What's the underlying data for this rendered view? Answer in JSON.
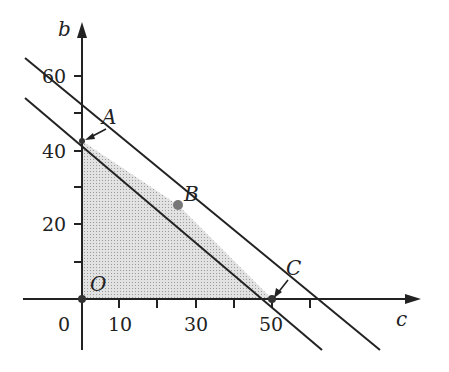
{
  "diagram": {
    "type": "linear-programming-feasible-region",
    "axes": {
      "x_label": "c",
      "y_label": "b",
      "origin_label": "0",
      "x_ticks": [
        {
          "value": 10,
          "label": "10"
        },
        {
          "value": 20,
          "label": ""
        },
        {
          "value": 30,
          "label": "30"
        },
        {
          "value": 40,
          "label": ""
        },
        {
          "value": 50,
          "label": "50"
        },
        {
          "value": 60,
          "label": ""
        }
      ],
      "y_ticks": [
        {
          "value": 10,
          "label": ""
        },
        {
          "value": 20,
          "label": "20"
        },
        {
          "value": 30,
          "label": ""
        },
        {
          "value": 40,
          "label": "40"
        },
        {
          "value": 50,
          "label": ""
        },
        {
          "value": 60,
          "label": "60"
        }
      ]
    },
    "points": {
      "O": {
        "label": "O",
        "c": 0,
        "b": 0
      },
      "A": {
        "label": "A",
        "c": 0,
        "b": 42.5
      },
      "B": {
        "label": "B",
        "c": 25,
        "b": 25
      },
      "C": {
        "label": "C",
        "c": 50,
        "b": 0
      }
    },
    "lines": [
      {
        "name": "constraint-1",
        "through": [
          [
            0,
            50
          ],
          [
            60,
            0
          ]
        ]
      },
      {
        "name": "constraint-2",
        "through": [
          [
            0,
            42.5
          ],
          [
            50,
            0
          ]
        ]
      }
    ],
    "feasible_region": [
      "O",
      "A",
      "B",
      "C"
    ],
    "colors": {
      "line": "#222222",
      "shade": "#d4d4d4",
      "point": "#555555"
    }
  }
}
